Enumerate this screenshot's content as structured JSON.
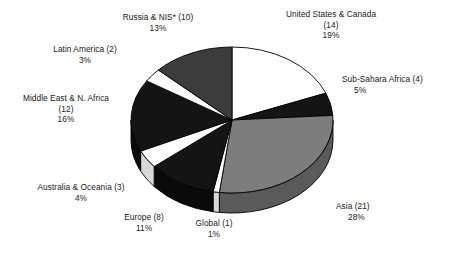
{
  "chart_data": {
    "type": "pie",
    "title": "",
    "subtitle": "",
    "xlabel": "",
    "ylabel": "",
    "legend_position": "callout-labels",
    "grid": false,
    "start_angle_deg": 0,
    "direction": "clockwise",
    "three_d": true,
    "total_count": 75,
    "categories": [
      "United States & Canada",
      "Sub-Sahara Africa",
      "Asia",
      "Global",
      "Europe",
      "Australia & Oceania",
      "Middle East & N. Africa",
      "Latin America",
      "Russia & NIS*"
    ],
    "values": [
      19,
      5,
      28,
      1,
      11,
      4,
      16,
      3,
      13
    ],
    "counts": [
      14,
      4,
      21,
      1,
      8,
      3,
      12,
      2,
      10
    ],
    "slices": [
      {
        "name": "United States & Canada",
        "count": 14,
        "percent": 19,
        "percent_label": "19%",
        "count_label": "(14)",
        "fill": "#ffffff",
        "side_fill": "#d8d8d8"
      },
      {
        "name": "Sub-Sahara Africa",
        "count": 4,
        "percent": 5,
        "percent_label": "5%",
        "count_label": "(4)",
        "fill": "#141414",
        "side_fill": "#0a0a0a"
      },
      {
        "name": "Asia",
        "count": 21,
        "percent": 28,
        "percent_label": "28%",
        "count_label": "(21)",
        "fill": "#7d7d7d",
        "side_fill": "#5a5a5a"
      },
      {
        "name": "Global",
        "count": 1,
        "percent": 1,
        "percent_label": "1%",
        "count_label": "(1)",
        "fill": "#ffffff",
        "side_fill": "#d8d8d8"
      },
      {
        "name": "Europe",
        "count": 8,
        "percent": 11,
        "percent_label": "11%",
        "count_label": "(8)",
        "fill": "#141414",
        "side_fill": "#0a0a0a"
      },
      {
        "name": "Australia & Oceania",
        "count": 3,
        "percent": 4,
        "percent_label": "4%",
        "count_label": "(3)",
        "fill": "#ffffff",
        "side_fill": "#d8d8d8"
      },
      {
        "name": "Middle East & N. Africa",
        "count": 12,
        "percent": 16,
        "percent_label": "16%",
        "count_label": "(12)",
        "fill": "#141414",
        "side_fill": "#0a0a0a"
      },
      {
        "name": "Latin America",
        "count": 2,
        "percent": 3,
        "percent_label": "3%",
        "count_label": "(2)",
        "fill": "#ffffff",
        "side_fill": "#d8d8d8"
      },
      {
        "name": "Russia & NIS*",
        "count": 10,
        "percent": 13,
        "percent_label": "13%",
        "count_label": "(10)",
        "fill": "#3c3c3c",
        "side_fill": "#262626"
      }
    ]
  },
  "labels": {
    "us_canada": {
      "line1": "United States & Canada",
      "line2": "(14)",
      "line3": "19%"
    },
    "sub_sahara": {
      "line1": "Sub-Sahara Africa (4)",
      "line2": "5%"
    },
    "asia": {
      "line1": "Asia (21)",
      "line2": "28%"
    },
    "global": {
      "line1": "Global (1)",
      "line2": "1%"
    },
    "europe": {
      "line1": "Europe (8)",
      "line2": "11%"
    },
    "australia": {
      "line1": "Australia & Oceania (3)",
      "line2": "4%"
    },
    "middle_east": {
      "line1": "Middle East & N. Africa",
      "line2": "(12)",
      "line3": "16%"
    },
    "latin_america": {
      "line1": "Latin America (2)",
      "line2": "3%"
    },
    "russia_nis": {
      "line1": "Russia & NIS* (10)",
      "line2": "13%"
    }
  },
  "colors": {
    "background": "#ffffff",
    "text": "#1a1a1a",
    "outline": "#000000",
    "white_slice": "#ffffff",
    "light_gray_slice": "#7d7d7d",
    "dark_gray_slice": "#3c3c3c",
    "black_slice": "#141414"
  }
}
